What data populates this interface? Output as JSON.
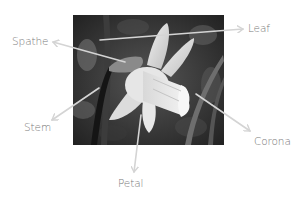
{
  "diagram": {
    "image_style": "grayscale photograph",
    "arrow_color": "#d4d4d4",
    "label_color": "#7a7a7a",
    "labels": [
      {
        "id": "leaf",
        "text": "Leaf",
        "x": 248,
        "y": 23,
        "arrow": {
          "from": [
            100,
            40
          ],
          "to": [
            243,
            29
          ]
        }
      },
      {
        "id": "spathe",
        "text": "Spathe",
        "x": 12,
        "y": 36,
        "arrow": {
          "from": [
            125,
            62
          ],
          "to": [
            53,
            42
          ]
        }
      },
      {
        "id": "stem",
        "text": "Stem",
        "x": 24,
        "y": 122,
        "arrow": {
          "from": [
            99,
            88
          ],
          "to": [
            52,
            120
          ]
        }
      },
      {
        "id": "corona",
        "text": "Corona",
        "x": 254,
        "y": 136,
        "arrow": {
          "from": [
            196,
            94
          ],
          "to": [
            250,
            131
          ]
        }
      },
      {
        "id": "petal",
        "text": "Petal",
        "x": 118,
        "y": 178,
        "arrow": {
          "from": [
            141,
            115
          ],
          "to": [
            134,
            172
          ]
        }
      }
    ]
  }
}
